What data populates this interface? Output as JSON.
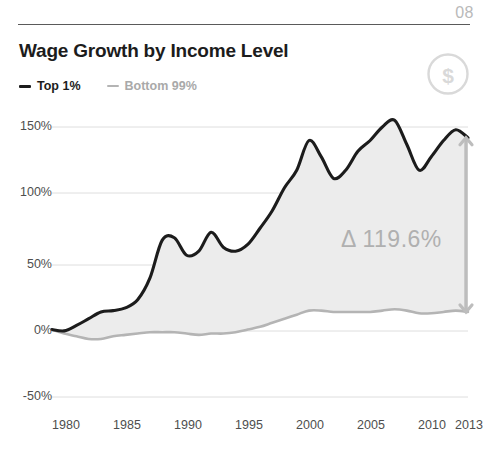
{
  "header": {
    "page_number": "08",
    "title": "Wage Growth by Income Level",
    "badge_icon": "dollar-circle-icon",
    "badge_glyph": "$"
  },
  "legend": {
    "items": [
      {
        "label": "Top 1%",
        "color": "#1c1c1c",
        "marker": "dash"
      },
      {
        "label": "Bottom 99%",
        "color": "#b4b4b4",
        "marker": "dash"
      }
    ]
  },
  "annotation": {
    "delta_label": "Δ 119.6%",
    "marker_icon": "vertical-double-arrow-icon",
    "marker_color": "#bdbdbd"
  },
  "chart_data": {
    "type": "area",
    "title": "Wage Growth by Income Level",
    "xlabel": "",
    "ylabel": "",
    "grid": true,
    "legend_position": "top-left",
    "xlim": [
      1979,
      2013
    ],
    "ylim": [
      -50,
      162
    ],
    "xticks": [
      1980,
      1985,
      1990,
      1995,
      2000,
      2005,
      2010,
      2013
    ],
    "xtick_labels": [
      "1980",
      "1985",
      "1990",
      "1995",
      "2000",
      "2005",
      "2010",
      "2013"
    ],
    "yticks": [
      -50,
      0,
      50,
      100,
      150
    ],
    "ytick_labels": [
      "-50%",
      "0%",
      "50%",
      "100%",
      "150%"
    ],
    "fill_between_series": true,
    "fill_color": "#ececec",
    "series": [
      {
        "name": "Top 1%",
        "color": "#1c1c1c",
        "x": [
          1979,
          1980,
          1981,
          1982,
          1983,
          1984,
          1985,
          1986,
          1987,
          1988,
          1989,
          1990,
          1991,
          1992,
          1993,
          1994,
          1995,
          1996,
          1997,
          1998,
          1999,
          2000,
          2001,
          2002,
          2003,
          2004,
          2005,
          2006,
          2007,
          2008,
          2009,
          2010,
          2011,
          2012,
          2013
        ],
        "values": [
          0,
          -1,
          3,
          8,
          13,
          14,
          16,
          22,
          38,
          66,
          68,
          55,
          58,
          72,
          61,
          58,
          63,
          75,
          88,
          105,
          118,
          140,
          128,
          112,
          118,
          132,
          140,
          150,
          155,
          137,
          118,
          128,
          140,
          148,
          142
        ]
      },
      {
        "name": "Bottom 99%",
        "color": "#b4b4b4",
        "x": [
          1979,
          1980,
          1981,
          1982,
          1983,
          1984,
          1985,
          1986,
          1987,
          1988,
          1989,
          1990,
          1991,
          1992,
          1993,
          1994,
          1995,
          1996,
          1997,
          1998,
          1999,
          2000,
          2001,
          2002,
          2003,
          2004,
          2005,
          2006,
          2007,
          2008,
          2009,
          2010,
          2011,
          2012,
          2013
        ],
        "values": [
          0,
          -3,
          -5,
          -7,
          -7,
          -5,
          -4,
          -3,
          -2,
          -2,
          -2,
          -3,
          -4,
          -3,
          -3,
          -2,
          0,
          2,
          5,
          8,
          11,
          14,
          14,
          13,
          13,
          13,
          13,
          14,
          15,
          14,
          12,
          12,
          13,
          14,
          13
        ]
      }
    ],
    "annotations": [
      {
        "text": "Δ 119.6%",
        "x": 2005,
        "y": 62,
        "color": "#b0b0b0"
      }
    ],
    "end_gap": {
      "top_pct": 142,
      "bottom_pct": 13,
      "difference_pct": 119.6
    }
  }
}
